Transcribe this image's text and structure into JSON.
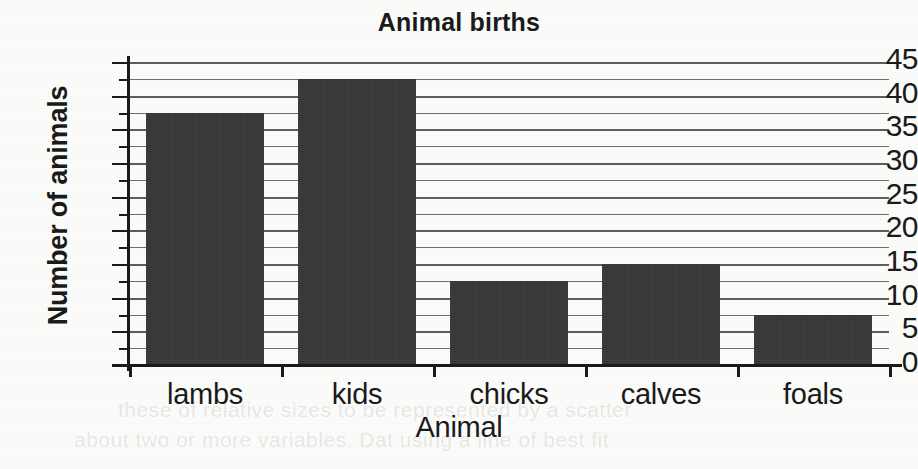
{
  "chart_data": {
    "type": "bar",
    "title": "Animal births",
    "xlabel": "Animal",
    "ylabel": "Number of animals",
    "categories": [
      "lambs",
      "kids",
      "chicks",
      "calves",
      "foals"
    ],
    "values": [
      37.5,
      42.5,
      12.5,
      15,
      7.5
    ],
    "ylim": [
      0,
      45
    ],
    "ytick_labels": [
      "0",
      "5",
      "10",
      "15",
      "20",
      "25",
      "30",
      "35",
      "40",
      "45"
    ],
    "ytick_values": [
      0,
      5,
      10,
      15,
      20,
      25,
      30,
      35,
      40,
      45
    ],
    "minor_tick_step": 2.5,
    "grid": "horizontal",
    "legend": null,
    "bar_color": "#343434",
    "axis_color": "#1a1a1a",
    "grid_color": "#5d5d5d",
    "background": "#fbfbf9"
  },
  "artifacts": {
    "bleed_line_1": "these of relative sizes to be represented by a scatter",
    "bleed_line_2": "about two or more variables. Dat using a line of best fit"
  }
}
